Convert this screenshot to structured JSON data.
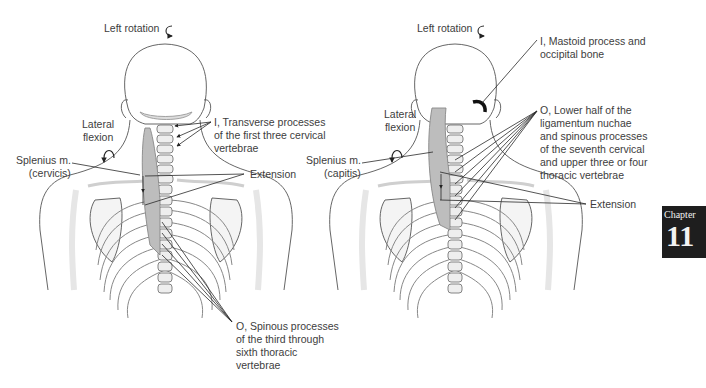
{
  "figure": {
    "panels": [
      {
        "id": "cervicis",
        "labels": {
          "rotation": "Left rotation",
          "lateral_flexion": [
            "Lateral",
            "flexion"
          ],
          "muscle": [
            "Splenius m.",
            "(cervicis)"
          ],
          "insertion": [
            "I, Transverse processes",
            "of the first three cervical",
            "vertebrae"
          ],
          "action": "Extension",
          "origin": [
            "O, Spinous processes",
            "of the third through",
            "sixth thoracic",
            "vertebrae"
          ]
        }
      },
      {
        "id": "capitis",
        "labels": {
          "rotation": "Left rotation",
          "lateral_flexion": [
            "Lateral",
            "flexion"
          ],
          "muscle": [
            "Splenius m.",
            "(capitis)"
          ],
          "insertion": [
            "I, Mastoid process and",
            "occipital bone"
          ],
          "origin": [
            "O, Lower half of the",
            "ligamentum nuchae",
            "and spinous processes",
            "of the seventh cervical",
            "and upper three or four",
            "thoracic vertebrae"
          ],
          "action": "Extension"
        }
      }
    ],
    "chapter_badge": {
      "label": "Chapter",
      "number": "11"
    }
  },
  "icons": {
    "rotation": "curved-arrow-icon",
    "lateral_flexion": "curved-arrow-down-icon"
  },
  "colors": {
    "line": "#2a2a2a",
    "bone": "#f3f3f3",
    "muscle": "#b9b9b9",
    "badge_bg": "#1e1e1e"
  }
}
